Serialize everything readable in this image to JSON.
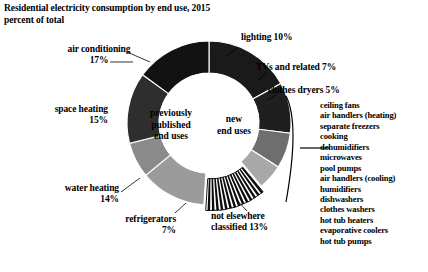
{
  "header": {
    "title": "Residential electricity consumption by end use, 2015",
    "subtitle": "percent of total"
  },
  "center": {
    "left_line1": "previously",
    "left_line2": "published",
    "left_line3": "end uses",
    "right_line1": "new",
    "right_line2": "end uses"
  },
  "callouts": {
    "air_conditioning": {
      "name": "air conditioning",
      "value": "17%"
    },
    "lighting": {
      "text": "lighting 10%"
    },
    "tvs": {
      "text": "TVs and related 7%"
    },
    "clothes_dryers": {
      "text": "clothes dryers 5%"
    },
    "space_heating": {
      "name": "space heating",
      "value": "15%"
    },
    "water_heating": {
      "name": "water heating",
      "value": "14%"
    },
    "refrigerators": {
      "name": "refrigerators",
      "value": "7%"
    },
    "not_elsewhere": {
      "line1": "not elsewhere",
      "line2": "classified 13%"
    }
  },
  "small_slice_list": [
    "ceiling fans",
    "air handlers (heating)",
    "separate freezers",
    "cooking",
    "dehumidifiers",
    "microwaves",
    "pool pumps",
    "air handlers (cooling)",
    "humidifiers",
    "dishwashers",
    "clothes washers",
    "hot tub heaters",
    "evaporative coolers",
    "hot tub pumps"
  ],
  "colors": {
    "background": "#ffffff",
    "text": "#000000",
    "air_conditioning": "#1a1a1a",
    "lighting": "#1f1f1f",
    "tvs": "#6e6e6e",
    "clothes_dryers": "#a8a8a8",
    "small_slices": "#0d0d0d",
    "not_elsewhere": "#9b9b9b",
    "refrigerators": "#8a8a8a",
    "water_heating": "#2e2e2e",
    "space_heating": "#121212",
    "stroke": "#ffffff"
  },
  "chart_data": {
    "type": "pie",
    "title": "Residential electricity consumption by end use, 2015",
    "subtitle": "percent of total",
    "ylabel": "percent of total",
    "xlabel": "",
    "donut": true,
    "inner_radius_ratio": 0.61,
    "start_angle_deg": 0,
    "direction": "clockwise",
    "groups": [
      "previously published end uses",
      "new end uses"
    ],
    "categories": [
      "air conditioning",
      "lighting",
      "TVs and related",
      "clothes dryers",
      "other new end uses (14 items)",
      "not elsewhere classified",
      "refrigerators",
      "water heating",
      "space heating"
    ],
    "values": [
      17,
      10,
      7,
      5,
      12,
      13,
      7,
      14,
      15
    ],
    "labels": [
      "air conditioning 17%",
      "lighting 10%",
      "TVs and related 7%",
      "clothes dryers 5%",
      "",
      "not elsewhere classified 13%",
      "refrigerators 7%",
      "water heating 14%",
      "space heating 15%"
    ],
    "legend_position": "callouts",
    "grid": false
  }
}
